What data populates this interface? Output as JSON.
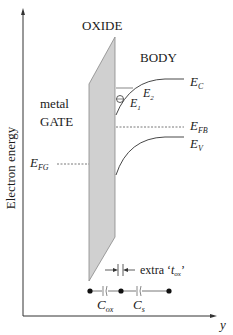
{
  "axes": {
    "y_axis_label": "Electron energy",
    "x_axis_label": "y"
  },
  "regions": {
    "oxide_label": "OXIDE",
    "body_label": "BODY",
    "gate_label_line1": "metal",
    "gate_label_line2": "GATE"
  },
  "levels": {
    "ec": {
      "main": "E",
      "sub": "C"
    },
    "e2": {
      "main": "E",
      "sub": "2"
    },
    "e1": {
      "main": "E",
      "sub": "1"
    },
    "efb": {
      "main": "E",
      "sub": "FB"
    },
    "ev": {
      "main": "E",
      "sub": "V"
    },
    "efg": {
      "main": "E",
      "sub": "FG"
    }
  },
  "circuit": {
    "extra_tox_prefix": "extra ‘",
    "extra_tox_main": "t",
    "extra_tox_sub": "ox",
    "extra_tox_suffix": "’",
    "cox": {
      "main": "C",
      "sub": "ox"
    },
    "cs": {
      "main": "C",
      "sub": "s"
    }
  },
  "colors": {
    "oxide_fill": "#d0d0d0",
    "line": "#333333"
  }
}
